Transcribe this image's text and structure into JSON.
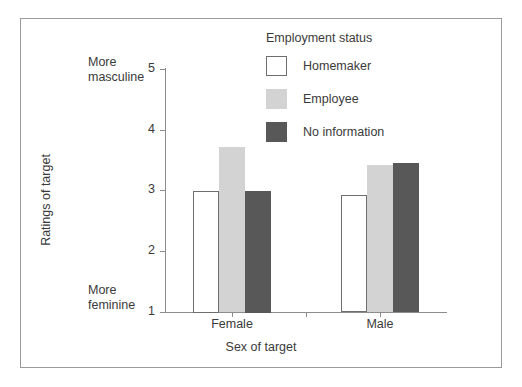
{
  "chart_data": {
    "type": "bar",
    "title": "",
    "xlabel": "Sex of target",
    "ylabel": "Ratings of target",
    "categories": [
      "Female",
      "Male"
    ],
    "series": [
      {
        "name": "Homemaker",
        "values": [
          3.0,
          2.93
        ],
        "color": "#ffffff"
      },
      {
        "name": "Employee",
        "values": [
          3.72,
          3.42
        ],
        "color": "#d3d3d3"
      },
      {
        "name": "No information",
        "values": [
          3.0,
          3.45
        ],
        "color": "#585858"
      }
    ],
    "ylim": [
      1,
      5
    ],
    "yticks": [
      "1",
      "2",
      "3",
      "4",
      "5"
    ],
    "grid": false,
    "legend_title": "Employment status",
    "legend_position": "top-right",
    "annotations": {
      "y_high": "More\nmasculine",
      "y_low": "More\nfeminine"
    }
  },
  "axis": {
    "y_label": "Ratings of target",
    "x_label": "Sex of target",
    "y_ticks": [
      "5",
      "4",
      "3",
      "2",
      "1"
    ],
    "x_ticks": [
      "Female",
      "Male"
    ],
    "high_anchor_line1": "More",
    "high_anchor_line2": "masculine",
    "low_anchor_line1": "More",
    "low_anchor_line2": "feminine"
  },
  "legend": {
    "title": "Employment status",
    "items": [
      {
        "label": "Homemaker",
        "swatch": "homemaker"
      },
      {
        "label": "Employee",
        "swatch": "employee"
      },
      {
        "label": "No information",
        "swatch": "noinfo"
      }
    ]
  },
  "colors": {
    "homemaker": "#ffffff",
    "employee": "#d3d3d3",
    "no_information": "#585858",
    "axis": "#8c8c8c",
    "frame": "#9a9a9a",
    "text": "#3a3a3a"
  }
}
